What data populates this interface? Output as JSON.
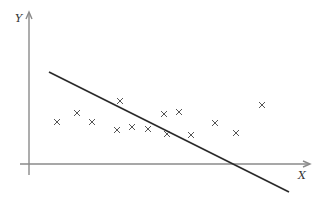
{
  "chart_data": {
    "type": "scatter",
    "title": "",
    "xlabel": "X",
    "ylabel": "Y",
    "marker": "x",
    "grid": false,
    "axes_px": {
      "origin": [
        29,
        164
      ],
      "x_end": [
        310,
        164
      ],
      "y_end": [
        29,
        12
      ]
    },
    "points_px": [
      [
        57,
        122
      ],
      [
        77,
        113
      ],
      [
        92,
        122
      ],
      [
        117,
        130
      ],
      [
        120,
        101
      ],
      [
        132,
        127
      ],
      [
        148,
        129
      ],
      [
        164,
        114
      ],
      [
        167,
        134
      ],
      [
        179,
        112
      ],
      [
        191,
        135
      ],
      [
        215,
        123
      ],
      [
        236,
        133
      ],
      [
        262,
        105
      ]
    ],
    "fit_line_px": {
      "start": [
        49,
        72
      ],
      "end": [
        289,
        192
      ]
    }
  },
  "labels": {
    "x_axis": "X",
    "y_axis": "Y"
  }
}
